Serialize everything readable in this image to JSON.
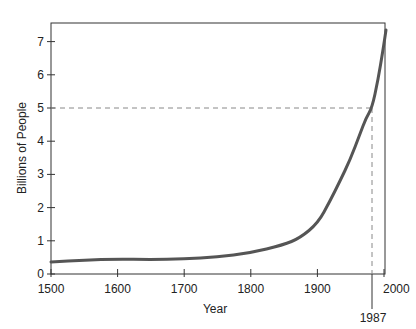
{
  "chart_data": {
    "type": "line",
    "title": "",
    "xlabel": "Year",
    "ylabel": "Billions of People",
    "xlim": [
      1500,
      2000
    ],
    "ylim": [
      0,
      7.6
    ],
    "xticks": [
      1500,
      1600,
      1700,
      1800,
      1900,
      2000
    ],
    "yticks": [
      0,
      1,
      2,
      3,
      4,
      5,
      6,
      7
    ],
    "grid": false,
    "legend": null,
    "series": [
      {
        "name": "World population",
        "x": [
          1500,
          1550,
          1600,
          1650,
          1700,
          1750,
          1800,
          1850,
          1900,
          1930,
          1950,
          1970,
          1987,
          2000
        ],
        "values": [
          0.36,
          0.42,
          0.45,
          0.44,
          0.45,
          0.52,
          0.63,
          0.95,
          1.6,
          2.2,
          2.9,
          3.9,
          5.0,
          7.3
        ]
      }
    ],
    "annotations": [
      {
        "type": "dashed-reference",
        "x": 1987,
        "y": 5,
        "label": "1987"
      }
    ]
  },
  "axes": {
    "x_title": "Year",
    "y_title": "Billions of People",
    "x_tick_labels": [
      "1500",
      "1600",
      "1700",
      "1800",
      "1900",
      "2000"
    ],
    "y_tick_labels": [
      "0",
      "1",
      "2",
      "3",
      "4",
      "5",
      "6",
      "7"
    ],
    "marker_label": "1987"
  },
  "colors": {
    "curve": "#555555",
    "axis": "#333333",
    "dashed": "#888888"
  }
}
